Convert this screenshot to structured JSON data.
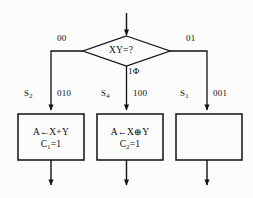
{
  "diagram": {
    "type": "asm-chart",
    "decision": {
      "label": "XY=?",
      "name": "decision-xy"
    },
    "branches": [
      {
        "label": "00",
        "direction": "left"
      },
      {
        "label": "1Φ",
        "direction": "down"
      },
      {
        "label": "01",
        "direction": "right"
      }
    ],
    "paths": [
      {
        "state_name": "S",
        "state_sub": "2",
        "state_code": "010",
        "box": {
          "line1_pre": "A",
          "line1_arrow": "←",
          "line1_post": "X+Y",
          "line2_pre": "C",
          "line2_sub": "1",
          "line2_post": "=1",
          "empty": false
        }
      },
      {
        "state_name": "S",
        "state_sub": "4",
        "state_code": "100",
        "box": {
          "line1_pre": "A",
          "line1_arrow": "←",
          "line1_post": "X⊕Y",
          "line2_pre": "C",
          "line2_sub": "2",
          "line2_post": "=1",
          "empty": false
        }
      },
      {
        "state_name": "S",
        "state_sub": "1",
        "state_code": "001",
        "box": {
          "line1_pre": "",
          "line1_arrow": "",
          "line1_post": "",
          "line2_pre": "",
          "line2_sub": "",
          "line2_post": "",
          "empty": true
        }
      }
    ],
    "colors": {
      "stroke": "#111111",
      "background": "#fcfcfc",
      "text": "#0d0d0d"
    }
  }
}
